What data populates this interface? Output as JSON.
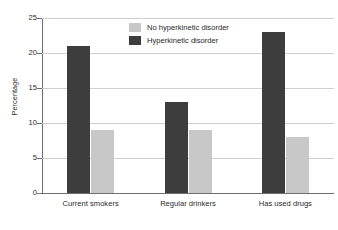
{
  "chart_data": {
    "type": "bar",
    "title": "",
    "xlabel": "",
    "ylabel": "Percentage",
    "ylim": [
      0,
      25
    ],
    "yticks": [
      0,
      5,
      10,
      15,
      20,
      25
    ],
    "grid": true,
    "legend_position": "top-center",
    "categories": [
      "Current smokers",
      "Regular drinkers",
      "Has used drugs"
    ],
    "series": [
      {
        "name": "No hyperkinetic disorder",
        "color": "#c8c8c8",
        "values": [
          9,
          9,
          8
        ]
      },
      {
        "name": "Hyperkinetic disorder",
        "color": "#3d3d3d",
        "values": [
          21,
          13,
          23
        ]
      }
    ]
  },
  "axis": {
    "y_title": "Percentage",
    "y_tick_labels": [
      "0",
      "5",
      "10",
      "15",
      "20",
      "25"
    ],
    "x_tick_labels": [
      "Current smokers",
      "Regular drinkers",
      "Has used drugs"
    ]
  },
  "legend": {
    "items": [
      {
        "label": "No hyperkinetic disorder",
        "swatch": "light"
      },
      {
        "label": "Hyperkinetic disorder",
        "swatch": "dark"
      }
    ]
  },
  "colors": {
    "bar_dark": "#3d3d3d",
    "bar_light": "#c8c8c8",
    "gridline": "#cfcfcf",
    "axis": "#6e6e6e",
    "text": "#2b2b2b",
    "background": "#ffffff"
  }
}
